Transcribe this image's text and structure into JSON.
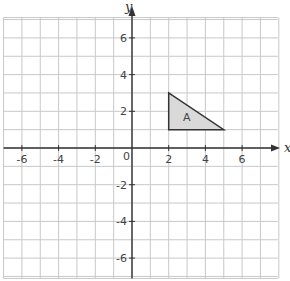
{
  "diagram": {
    "type": "coordinate-grid",
    "x_axis": {
      "label": "x",
      "range": [
        -7,
        8
      ],
      "tick_labels": [
        "-6",
        "-4",
        "-2",
        "2",
        "4",
        "6"
      ],
      "tick_values": [
        -6,
        -4,
        -2,
        2,
        4,
        6
      ]
    },
    "y_axis": {
      "label": "y",
      "range": [
        -7,
        7
      ],
      "tick_labels": [
        "6",
        "4",
        "2",
        "-2",
        "-4",
        "-6"
      ],
      "tick_values": [
        6,
        4,
        2,
        -2,
        -4,
        -6
      ]
    },
    "origin_label": "0",
    "grid": true,
    "shapes": [
      {
        "name": "A",
        "label": "A",
        "vertices": [
          [
            2,
            1
          ],
          [
            2,
            3
          ],
          [
            5,
            1
          ]
        ],
        "fill": "#d9d9d9"
      }
    ]
  }
}
